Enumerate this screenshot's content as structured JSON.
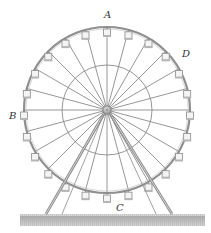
{
  "figure": {
    "labels": {
      "A": "A",
      "B": "B",
      "C": "C",
      "D": "D"
    },
    "geometry": {
      "hub": [
        107,
        110
      ],
      "outer_radius": 83,
      "inner_radius": 45,
      "spoke_count": 24,
      "gondola_count": 24
    },
    "colors": {
      "line": "#8a8a8a",
      "rim": "#8f8f8f",
      "ground": "#b8b8b8",
      "gondola_fill": "#f4f4f4",
      "text": "#333333"
    }
  }
}
